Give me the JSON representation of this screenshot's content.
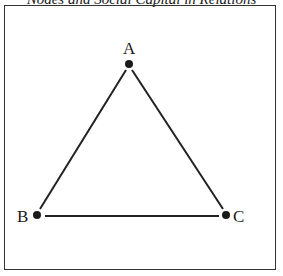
{
  "title": "Nodes and Social Capital in Relations",
  "nodes": [
    {
      "id": "A",
      "label": "A",
      "x": 129,
      "y": 64
    },
    {
      "id": "B",
      "label": "B",
      "x": 37,
      "y": 215
    },
    {
      "id": "C",
      "label": "C",
      "x": 226,
      "y": 215
    }
  ],
  "edges": [
    [
      "A",
      "B"
    ],
    [
      "A",
      "C"
    ],
    [
      "B",
      "C"
    ]
  ],
  "colors": {
    "line": "#222222",
    "node": "#1a1a1a"
  }
}
